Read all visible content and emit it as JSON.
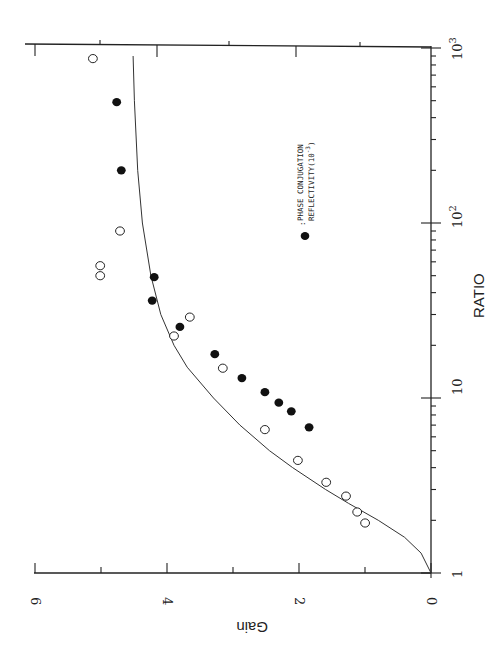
{
  "chart_data": {
    "type": "scatter",
    "orientation_note_visible": "plot rendered rotated 90° counter-clockwise",
    "xlabel": "RATIO",
    "ylabel": "Gain",
    "xscale": "log",
    "xlim": [
      1,
      1000
    ],
    "ylim": [
      0,
      6
    ],
    "x_tick_labels": [
      "1",
      "10",
      "10^2",
      "10^3"
    ],
    "y_tick_labels": [
      "0",
      "2",
      "4",
      "6"
    ],
    "grid": false,
    "legend": {
      "marker": "filled-circle",
      "label_line1": "PHASE CONJUGATION",
      "label_line2": "REFLECTIVITY(10",
      "label_exp": "-3",
      "label_close": ")"
    },
    "series": [
      {
        "name": "Phase conjugation reflectivity (10^-3)",
        "marker": "filled-circle",
        "points": [
          [
            6.8,
            1.85
          ],
          [
            8.4,
            2.12
          ],
          [
            9.4,
            2.31
          ],
          [
            10.8,
            2.52
          ],
          [
            13,
            2.87
          ],
          [
            17.8,
            3.28
          ],
          [
            25.5,
            3.81
          ],
          [
            36,
            4.23
          ],
          [
            49,
            4.2
          ],
          [
            200,
            4.7
          ],
          [
            490,
            4.77
          ]
        ]
      },
      {
        "name": "Gain (measured)",
        "marker": "open-circle",
        "points": [
          [
            1.93,
            1.0
          ],
          [
            2.23,
            1.12
          ],
          [
            2.75,
            1.29
          ],
          [
            3.3,
            1.59
          ],
          [
            4.4,
            2.02
          ],
          [
            6.6,
            2.52
          ],
          [
            14.8,
            3.16
          ],
          [
            22.6,
            3.9
          ],
          [
            29,
            3.66
          ],
          [
            50,
            5.02
          ],
          [
            57,
            5.02
          ],
          [
            90,
            4.72
          ],
          [
            870,
            5.13
          ]
        ]
      },
      {
        "name": "Theory",
        "type": "line",
        "points": [
          [
            1,
            0
          ],
          [
            1.3,
            0.15
          ],
          [
            1.6,
            0.4
          ],
          [
            2,
            0.8
          ],
          [
            2.5,
            1.25
          ],
          [
            3,
            1.6
          ],
          [
            4,
            2.1
          ],
          [
            5,
            2.45
          ],
          [
            7,
            2.9
          ],
          [
            10,
            3.3
          ],
          [
            15,
            3.7
          ],
          [
            20,
            3.9
          ],
          [
            30,
            4.1
          ],
          [
            50,
            4.25
          ],
          [
            100,
            4.38
          ],
          [
            200,
            4.45
          ],
          [
            500,
            4.5
          ],
          [
            900,
            4.52
          ]
        ]
      }
    ]
  },
  "axes": {
    "ratio_label": "RATIO",
    "gain_label": "Gain",
    "ratio_ticks": [
      "1",
      "10",
      "10",
      "10"
    ],
    "ratio_exps": [
      "",
      "",
      "2",
      "3"
    ],
    "gain_ticks": [
      "0",
      "2",
      "4",
      "6"
    ]
  }
}
